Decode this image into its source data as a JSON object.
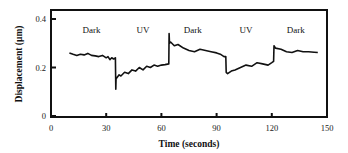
{
  "chart_data": {
    "type": "line",
    "title": "",
    "xlabel": "Time (seconds)",
    "ylabel": "Displacement  (µm)",
    "xlim": [
      0,
      150
    ],
    "ylim": [
      0,
      0.45
    ],
    "xticks": [
      0,
      30,
      60,
      90,
      120,
      150
    ],
    "xtick_labels": [
      "0",
      "30",
      "60",
      "90",
      "120",
      "150"
    ],
    "yticks": [
      0,
      0.2,
      0.4
    ],
    "ytick_labels": [
      "0",
      "0.2",
      "0.4"
    ],
    "grid": false,
    "legend": null,
    "annotations": [
      {
        "text": "Dark",
        "x": 22,
        "y": 0.39
      },
      {
        "text": "UV",
        "x": 50,
        "y": 0.39
      },
      {
        "text": "Dark",
        "x": 77,
        "y": 0.39
      },
      {
        "text": "UV",
        "x": 106,
        "y": 0.39
      },
      {
        "text": "Dark",
        "x": 133,
        "y": 0.39
      }
    ],
    "series": [
      {
        "name": "Displacement",
        "x": [
          10,
          12,
          14,
          16,
          18,
          20,
          22,
          24,
          26,
          28,
          30,
          31,
          32,
          33,
          34,
          35,
          35.2,
          35.4,
          35.6,
          37,
          38,
          40,
          42,
          44,
          46,
          48,
          50,
          52,
          54,
          56,
          58,
          60,
          62,
          64,
          64.2,
          64.4,
          65,
          67,
          69,
          72,
          75,
          78,
          81,
          84,
          87,
          90,
          92,
          94,
          95,
          95.2,
          96,
          98,
          100,
          103,
          106,
          109,
          112,
          115,
          118,
          120,
          121,
          121.2,
          122,
          125,
          128,
          131,
          134,
          137,
          140,
          143,
          145
        ],
        "values": [
          0.26,
          0.255,
          0.25,
          0.255,
          0.252,
          0.258,
          0.25,
          0.248,
          0.245,
          0.25,
          0.24,
          0.245,
          0.232,
          0.24,
          0.235,
          0.24,
          0.11,
          0.16,
          0.155,
          0.17,
          0.165,
          0.18,
          0.175,
          0.19,
          0.185,
          0.2,
          0.19,
          0.205,
          0.2,
          0.21,
          0.205,
          0.21,
          0.212,
          0.215,
          0.34,
          0.3,
          0.305,
          0.29,
          0.295,
          0.28,
          0.27,
          0.265,
          0.275,
          0.27,
          0.265,
          0.26,
          0.255,
          0.245,
          0.245,
          0.18,
          0.175,
          0.185,
          0.19,
          0.2,
          0.21,
          0.205,
          0.22,
          0.215,
          0.21,
          0.22,
          0.225,
          0.29,
          0.28,
          0.275,
          0.265,
          0.262,
          0.27,
          0.265,
          0.265,
          0.263,
          0.262
        ]
      }
    ]
  },
  "colors": {
    "line": "#111111",
    "axis": "#111111",
    "background": "#ffffff"
  }
}
